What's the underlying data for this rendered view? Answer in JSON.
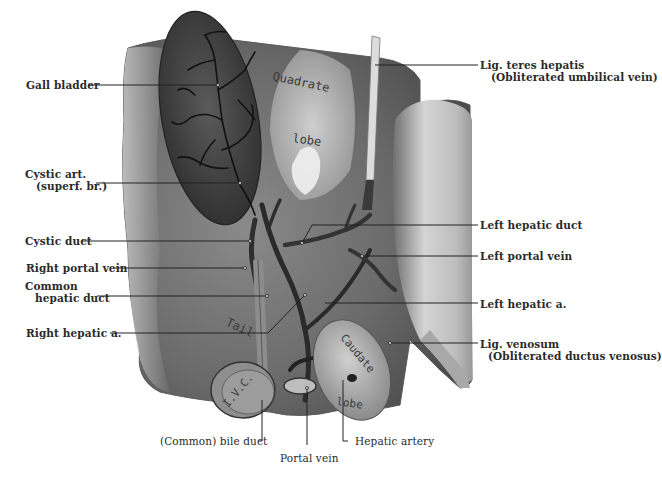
{
  "figure": {
    "labels_left": [
      {
        "id": "gall-bladder",
        "text": "Gall bladder",
        "sub": ""
      },
      {
        "id": "cystic-art",
        "text": "Cystic art.",
        "sub": "(superf. br.)"
      },
      {
        "id": "cystic-duct",
        "text": "Cystic duct",
        "sub": ""
      },
      {
        "id": "right-portal-vein",
        "text": "Right portal vein",
        "sub": ""
      },
      {
        "id": "common-hepatic-duct",
        "text": "Common",
        "sub": "hepatic duct"
      },
      {
        "id": "right-hepatic-a",
        "text": "Right hepatic a.",
        "sub": ""
      }
    ],
    "labels_right": [
      {
        "id": "lig-teres",
        "text": "Lig. teres hepatis",
        "sub": "(Obliterated umbilical vein)"
      },
      {
        "id": "left-hepatic-duct",
        "text": "Left hepatic duct",
        "sub": ""
      },
      {
        "id": "left-portal-vein",
        "text": "Left portal vein",
        "sub": ""
      },
      {
        "id": "left-hepatic-a",
        "text": "Left hepatic a.",
        "sub": ""
      },
      {
        "id": "lig-venosum",
        "text": "Lig. venosum",
        "sub": "(Obliterated ductus venosus)"
      }
    ],
    "labels_bottom": [
      {
        "id": "common-bile-duct",
        "text": "(Common) bile duct"
      },
      {
        "id": "portal-vein",
        "text": "Portal vein"
      },
      {
        "id": "hepatic-artery",
        "text": "Hepatic artery"
      }
    ],
    "in_image_labels": {
      "quadrate": "Quadrate",
      "quadrate_lobe": "lobe",
      "tail": "Tail",
      "caudate": "Caudate",
      "caudate_lobe": "lobe",
      "ivc": "I.V.C."
    }
  }
}
